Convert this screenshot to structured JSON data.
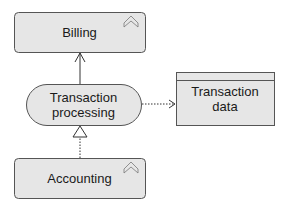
{
  "diagram": {
    "nodes": {
      "billing": {
        "label": "Billing",
        "type": "application-component",
        "icon": "collapse-chevron-icon"
      },
      "transaction_processing": {
        "label_line1": "Transaction",
        "label_line2": "processing",
        "type": "application-service"
      },
      "accounting": {
        "label": "Accounting",
        "type": "application-component",
        "icon": "collapse-chevron-icon"
      },
      "transaction_data": {
        "label_line1": "Transaction",
        "label_line2": "data",
        "type": "data-object"
      }
    },
    "edges": [
      {
        "from": "transaction_processing",
        "to": "billing",
        "style": "solid",
        "arrow": "open"
      },
      {
        "from": "accounting",
        "to": "transaction_processing",
        "style": "dotted",
        "arrow": "hollow-triangle"
      },
      {
        "from": "transaction_processing",
        "to": "transaction_data",
        "style": "dotted",
        "arrow": "open"
      }
    ],
    "colors": {
      "fill": "#e6e6e6",
      "stroke": "#555555",
      "line": "#333333"
    }
  }
}
